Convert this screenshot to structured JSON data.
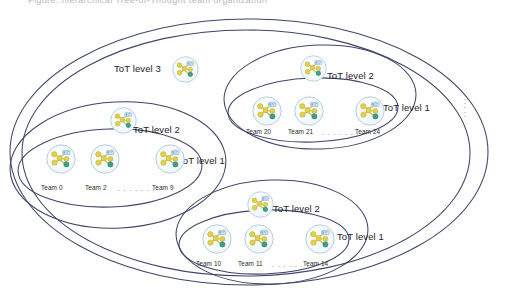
{
  "figure": {
    "title_fragment": "Figure: hierarchical Tree-of-Thought team organization",
    "stroke_color": "#3d4668",
    "node_fill_yellow": "#e0d14a",
    "node_fill_green": "#3f9e8c",
    "node_fill_lightblue": "#cfe3ee",
    "icon_bg": "#f4f8fb",
    "icon_ring": "#a9c9dd"
  },
  "levels": [
    {
      "id": "tot-level-3",
      "label": "ToT level 3",
      "x": 114,
      "y": 63
    },
    {
      "id": "tot-level-2-left",
      "label": "ToT level 2",
      "x": 133,
      "y": 124
    },
    {
      "id": "tot-level-1-left",
      "label": "ToT level 1",
      "x": 178,
      "y": 155
    },
    {
      "id": "tot-level-2-topright",
      "label": "ToT level 2",
      "x": 327,
      "y": 70
    },
    {
      "id": "tot-level-1-topright",
      "label": "ToT level 1",
      "x": 383,
      "y": 102
    },
    {
      "id": "tot-level-2-bottom",
      "label": "ToT level 2",
      "x": 273,
      "y": 203
    },
    {
      "id": "tot-level-1-bottom",
      "label": "ToT level 1",
      "x": 337,
      "y": 231
    }
  ],
  "groups": [
    {
      "id": "group-left",
      "teams": [
        {
          "label": "Team 0",
          "x": 41,
          "y": 184,
          "icon_x": 46,
          "icon_y": 144
        },
        {
          "label": "Team 2",
          "x": 85,
          "y": 184,
          "icon_x": 90,
          "icon_y": 144
        },
        {
          "label": "Team 9",
          "x": 152,
          "y": 184,
          "icon_x": 155,
          "icon_y": 144
        }
      ],
      "dots": {
        "text": ". . . . . . .",
        "x": 118,
        "y": 185
      }
    },
    {
      "id": "group-top-right",
      "teams": [
        {
          "label": "Team 20",
          "x": 246,
          "y": 128,
          "icon_x": 252,
          "icon_y": 96
        },
        {
          "label": "Team 21",
          "x": 288,
          "y": 128,
          "icon_x": 294,
          "icon_y": 96
        },
        {
          "label": "Team 24",
          "x": 355,
          "y": 128,
          "icon_x": 355,
          "icon_y": 96
        }
      ],
      "dots": {
        "text": ". . . . . . .",
        "x": 322,
        "y": 129
      }
    },
    {
      "id": "group-bottom",
      "teams": [
        {
          "label": "Team 10",
          "x": 196,
          "y": 260,
          "icon_x": 202,
          "icon_y": 224
        },
        {
          "label": "Team 11",
          "x": 238,
          "y": 260,
          "icon_x": 244,
          "icon_y": 224
        },
        {
          "label": "Team 14",
          "x": 303,
          "y": 260,
          "icon_x": 305,
          "icon_y": 224
        }
      ],
      "dots": {
        "text": ". . . . . . .",
        "x": 272,
        "y": 261
      }
    }
  ],
  "standalone_icons": [
    {
      "id": "icon-level-3",
      "x": 172,
      "y": 56,
      "size": 27
    },
    {
      "id": "icon-level-2-left",
      "x": 110,
      "y": 107,
      "size": 27
    },
    {
      "id": "icon-level-2-topright",
      "x": 300,
      "y": 55,
      "size": 27
    },
    {
      "id": "icon-level-2-bottom",
      "x": 247,
      "y": 191,
      "size": 27
    }
  ],
  "continuation": {
    "dots": ".\n.\n.\n.\n.",
    "x": 464,
    "y": 96
  }
}
